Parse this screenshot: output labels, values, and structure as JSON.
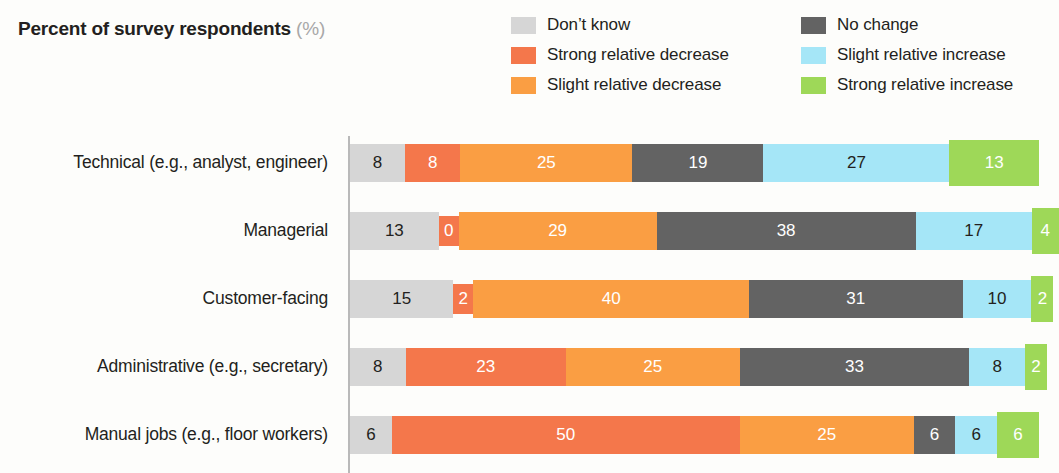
{
  "header": {
    "title_main": "Percent of survey respondents",
    "title_unit": "(%)"
  },
  "legend": {
    "columns": [
      {
        "items": [
          {
            "label": "Don’t know",
            "color": "#d6d6d6",
            "key": "dont_know"
          },
          {
            "label": "Strong relative decrease",
            "color": "#f4774b",
            "key": "strong_decrease"
          },
          {
            "label": "Slight relative decrease",
            "color": "#fa9e43",
            "key": "slight_decrease"
          }
        ]
      },
      {
        "items": [
          {
            "label": "No change",
            "color": "#636363",
            "key": "no_change"
          },
          {
            "label": "Slight relative increase",
            "color": "#a5e6f7",
            "key": "slight_increase"
          },
          {
            "label": "Strong relative increase",
            "color": "#9ed858",
            "key": "strong_increase"
          }
        ]
      }
    ]
  },
  "chart_data": {
    "type": "bar",
    "orientation": "horizontal",
    "stacked": true,
    "title": "Percent of survey respondents (%)",
    "xlabel": "",
    "ylabel": "",
    "xlim": [
      0,
      100
    ],
    "grid": false,
    "legend_position": "top-right",
    "categories": [
      "Technical (e.g., analyst, engineer)",
      "Managerial",
      "Customer-facing",
      "Administrative (e.g., secretary)",
      "Manual jobs (e.g., floor workers)"
    ],
    "series": [
      {
        "name": "Don’t know",
        "color": "#d6d6d6",
        "values": [
          8,
          13,
          15,
          8,
          6
        ]
      },
      {
        "name": "Strong relative decrease",
        "color": "#f4774b",
        "values": [
          8,
          0,
          2,
          23,
          50
        ]
      },
      {
        "name": "Slight relative decrease",
        "color": "#fa9e43",
        "values": [
          25,
          29,
          40,
          25,
          25
        ]
      },
      {
        "name": "No change",
        "color": "#636363",
        "values": [
          19,
          38,
          31,
          33,
          6
        ]
      },
      {
        "name": "Slight relative increase",
        "color": "#a5e6f7",
        "values": [
          27,
          17,
          10,
          8,
          6
        ]
      },
      {
        "name": "Strong relative increase",
        "color": "#9ed858",
        "values": [
          13,
          4,
          2,
          2,
          6
        ]
      }
    ],
    "rows": [
      {
        "label": "Technical (e.g., analyst, engineer)",
        "segments": [
          {
            "key": "dk",
            "value": 8,
            "label": "8"
          },
          {
            "key": "sd",
            "value": 8,
            "label": "8"
          },
          {
            "key": "ld",
            "value": 25,
            "label": "25"
          },
          {
            "key": "nc",
            "value": 19,
            "label": "19"
          },
          {
            "key": "li",
            "value": 27,
            "label": "27"
          },
          {
            "key": "si",
            "value": 13,
            "label": "13"
          }
        ]
      },
      {
        "label": "Managerial",
        "segments": [
          {
            "key": "dk",
            "value": 13,
            "label": "13"
          },
          {
            "key": "sd",
            "value": 0,
            "label": "0"
          },
          {
            "key": "ld",
            "value": 29,
            "label": "29"
          },
          {
            "key": "nc",
            "value": 38,
            "label": "38"
          },
          {
            "key": "li",
            "value": 17,
            "label": "17"
          },
          {
            "key": "si",
            "value": 4,
            "label": "4"
          }
        ]
      },
      {
        "label": "Customer-facing",
        "segments": [
          {
            "key": "dk",
            "value": 15,
            "label": "15"
          },
          {
            "key": "sd",
            "value": 2,
            "label": "2"
          },
          {
            "key": "ld",
            "value": 40,
            "label": "40"
          },
          {
            "key": "nc",
            "value": 31,
            "label": "31"
          },
          {
            "key": "li",
            "value": 10,
            "label": "10"
          },
          {
            "key": "si",
            "value": 2,
            "label": "2"
          }
        ]
      },
      {
        "label": "Administrative (e.g., secretary)",
        "segments": [
          {
            "key": "dk",
            "value": 8,
            "label": "8"
          },
          {
            "key": "sd",
            "value": 23,
            "label": "23"
          },
          {
            "key": "ld",
            "value": 25,
            "label": "25"
          },
          {
            "key": "nc",
            "value": 33,
            "label": "33"
          },
          {
            "key": "li",
            "value": 8,
            "label": "8"
          },
          {
            "key": "si",
            "value": 2,
            "label": "2"
          }
        ]
      },
      {
        "label": "Manual jobs (e.g., floor workers)",
        "segments": [
          {
            "key": "dk",
            "value": 6,
            "label": "6"
          },
          {
            "key": "sd",
            "value": 50,
            "label": "50"
          },
          {
            "key": "ld",
            "value": 25,
            "label": "25"
          },
          {
            "key": "nc",
            "value": 6,
            "label": "6"
          },
          {
            "key": "li",
            "value": 6,
            "label": "6"
          },
          {
            "key": "si",
            "value": 6,
            "label": "6"
          }
        ]
      }
    ]
  },
  "colors": {
    "dk": "#d6d6d6",
    "sd": "#f4774b",
    "ld": "#fa9e43",
    "nc": "#636363",
    "li": "#a5e6f7",
    "si": "#9ed858",
    "axis": "#b9b9b9",
    "background": "#fdfdfb",
    "text": "#231f20",
    "unit_text": "#a8a8a8"
  }
}
